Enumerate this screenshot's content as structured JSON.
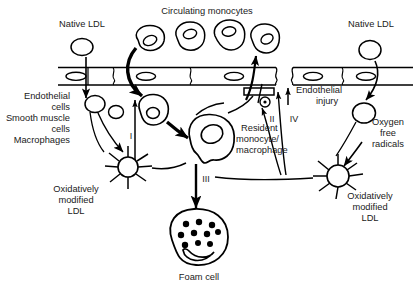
{
  "figure": {
    "type": "biological-pathway-diagram",
    "background_color": "#ffffff",
    "line_color": "#000000",
    "text_color": "#1a1a1a"
  },
  "labels": {
    "native_ldl_left": "Native LDL",
    "native_ldl_right": "Native LDL",
    "circulating_monocytes": "Circulating monocytes",
    "endothelial_cells": "Endothelial",
    "cells_1": "cells",
    "smooth_muscle": "Smooth muscle",
    "cells_2": "cells",
    "macrophages": "Macrophages",
    "endothelial_injury_line1": "Endothelial",
    "endothelial_injury_line2": "injury",
    "oxygen_free_line1": "Oxygen",
    "oxygen_free_line2": "free",
    "oxygen_free_line3": "radicals",
    "resident_line1": "Resident",
    "resident_line2": "monocyte/",
    "resident_line3": "macrophage",
    "ox_ldl_left_line1": "Oxidatively",
    "ox_ldl_left_line2": "modified",
    "ox_ldl_left_line3": "LDL",
    "ox_ldl_right_line1": "Oxidatively",
    "ox_ldl_right_line2": "modified",
    "ox_ldl_right_line3": "LDL",
    "foam_cell": "Foam cell"
  },
  "step_numbers": {
    "step_1": "I",
    "step_2": "II",
    "step_3": "III",
    "step_4": "IV"
  },
  "structures": {
    "endothelium_label": "endothelium-band",
    "endothelial_gap_label": "endothelial-injury-gap",
    "receptor_label": "scavenger-receptor",
    "monocyte_count": 4,
    "foam_cell_droplet_count": 10
  }
}
